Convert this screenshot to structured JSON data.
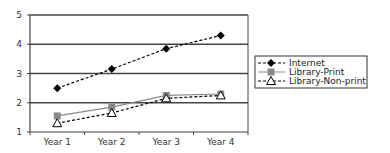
{
  "chart_data": {
    "type": "line",
    "title": "",
    "xlabel": "",
    "ylabel": "",
    "categories": [
      "Year 1",
      "Year 2",
      "Year 3",
      "Year 4"
    ],
    "ylim": [
      1,
      5
    ],
    "yticks": [
      "1",
      "2",
      "3",
      "4",
      "5"
    ],
    "grid": true,
    "legend_position": "right",
    "series": [
      {
        "name": "Internet",
        "values": [
          2.5,
          3.15,
          3.85,
          4.3
        ],
        "marker": "diamond",
        "line": "dashed",
        "color": "#000000"
      },
      {
        "name": "Library-Print",
        "values": [
          1.55,
          1.85,
          2.25,
          2.3
        ],
        "marker": "square",
        "line": "solid",
        "color": "#888888"
      },
      {
        "name": "Library-Non-print",
        "values": [
          1.3,
          1.65,
          2.15,
          2.25
        ],
        "marker": "triangle-open",
        "line": "dashed",
        "color": "#000000"
      }
    ]
  }
}
